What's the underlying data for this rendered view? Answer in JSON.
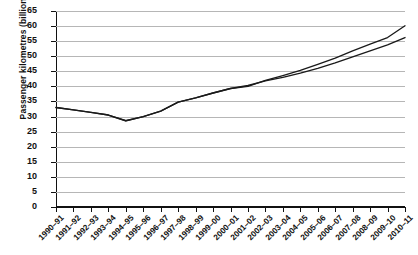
{
  "chart_data": {
    "type": "line",
    "title": "",
    "xlabel": "",
    "ylabel": "Passenger kilometres (billions)",
    "ylim": [
      0,
      65
    ],
    "ytick_step": 5,
    "yticks": [
      0,
      5,
      10,
      15,
      20,
      25,
      30,
      35,
      40,
      45,
      50,
      55,
      60,
      65
    ],
    "grid": true,
    "legend": "none",
    "categories": [
      "1990–91",
      "1991–92",
      "1992–93",
      "1993–94",
      "1994–95",
      "1995–96",
      "1996–97",
      "1997–98",
      "1998–99",
      "1999–00",
      "2000–01",
      "2001–02",
      "2002–03",
      "2003–04",
      "2004–05",
      "2005–06",
      "2006–07",
      "2007–08",
      "2008–09",
      "2009–10",
      "2010–11"
    ],
    "series": [
      {
        "name": "series-upper",
        "color": "#1a1a1a",
        "values": [
          33.0,
          32.2,
          31.4,
          30.5,
          28.6,
          30.0,
          31.8,
          34.8,
          36.2,
          37.8,
          39.3,
          40.0,
          42.0,
          43.6,
          45.3,
          47.3,
          49.4,
          51.8,
          54.0,
          56.2,
          60.1
        ]
      },
      {
        "name": "series-lower",
        "color": "#1a1a1a",
        "values": [
          33.0,
          32.2,
          31.4,
          30.5,
          28.6,
          30.0,
          31.8,
          34.8,
          36.2,
          37.8,
          39.3,
          40.3,
          41.8,
          43.0,
          44.4,
          46.0,
          47.8,
          49.8,
          51.8,
          53.8,
          56.2
        ]
      }
    ]
  },
  "axis": {
    "y_title": "Passenger kilometres (billions)"
  }
}
